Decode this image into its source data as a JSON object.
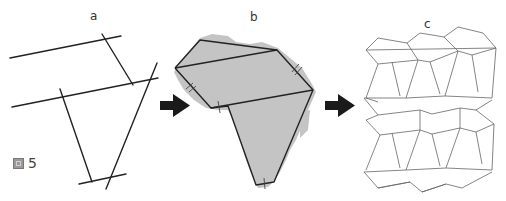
{
  "figure": {
    "label_text": "5",
    "label_icon": "figure-glyph-icon"
  },
  "panels": {
    "a": {
      "label": "a",
      "description": "Construction lines"
    },
    "b": {
      "label": "b",
      "description": "Africa outline approximated by polygon"
    },
    "c": {
      "label": "c",
      "description": "Tessellation of the polygon tile"
    }
  },
  "colors": {
    "line": "#222222",
    "thin_line": "#666666",
    "land": "#c4c4c4",
    "arrow": "#1a1a1a"
  }
}
